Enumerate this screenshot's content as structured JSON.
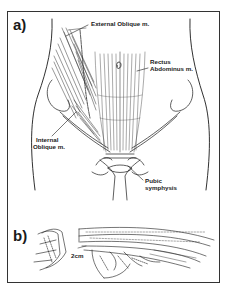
{
  "figure": {
    "panels": [
      {
        "id": "a",
        "label": "a)",
        "annotations": {
          "external_oblique": "External Oblique m.",
          "rectus_abdominus_line1": "Rectus",
          "rectus_abdominus_line2": "Abdominus m.",
          "internal_oblique_line1": "Internal",
          "internal_oblique_line2": "Oblique m.",
          "pubic_symphysis_line1": "Pubic",
          "pubic_symphysis_line2": "symphysis"
        }
      },
      {
        "id": "b",
        "label": "b)",
        "annotations": {
          "scale": "2cm"
        }
      }
    ],
    "colors": {
      "ink": "#1a1a1a",
      "background": "#ffffff",
      "frame": "#333333"
    }
  }
}
